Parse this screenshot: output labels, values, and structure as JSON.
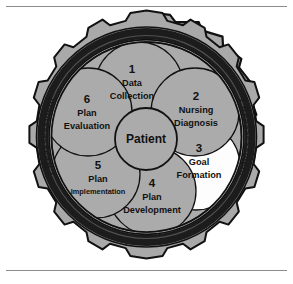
{
  "diagram": {
    "center": {
      "label": "Patient"
    },
    "ring": {
      "step_number": "7",
      "label": "Reassessment",
      "full_text": "7 Reassessment",
      "repetitions": 4
    },
    "segments": [
      {
        "number": "1",
        "line1": "Data",
        "line2": "Collection",
        "highlight": false
      },
      {
        "number": "2",
        "line1": "Nursing",
        "line2": "Diagnosis",
        "highlight": false
      },
      {
        "number": "3",
        "line1": "Goal",
        "line2": "Formation",
        "highlight": true
      },
      {
        "number": "4",
        "line1": "Plan",
        "line2": "Development",
        "highlight": false
      },
      {
        "number": "5",
        "line1": "Plan",
        "line2": "Implementation",
        "highlight": false
      },
      {
        "number": "6",
        "line1": "Plan",
        "line2": "Evaluation",
        "highlight": false
      }
    ],
    "colors": {
      "segment_fill": "#ababab",
      "segment_highlight_fill": "#fdfdfd",
      "gear_fill": "#a9a9a9",
      "gear_dark_band": "#1c1c1c",
      "outline": "#111111",
      "page_background": "#ffffff",
      "rule": "#8c8c8c"
    }
  }
}
